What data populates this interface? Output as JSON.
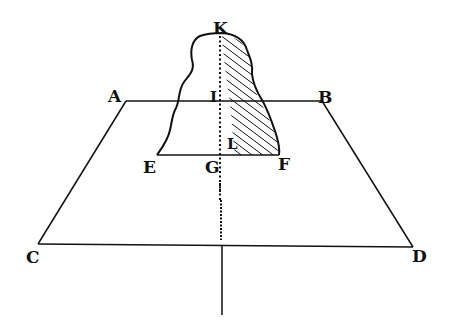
{
  "figure": {
    "colors": {
      "ink": "#111111",
      "paper": "#ffffff"
    },
    "labels": {
      "K": "K",
      "A": "A",
      "B": "B",
      "I": "I",
      "L": "L",
      "E": "E",
      "G": "G",
      "F": "F",
      "C": "C",
      "D": "D"
    }
  }
}
